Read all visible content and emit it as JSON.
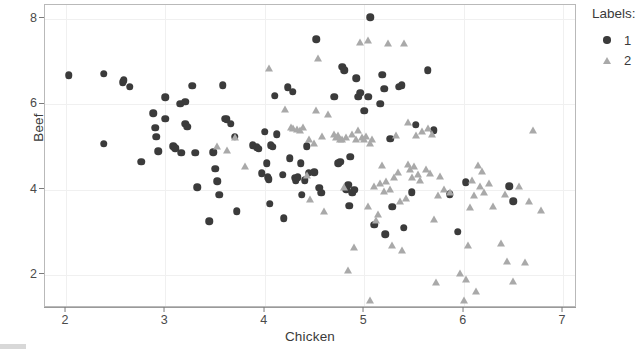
{
  "axes": {
    "x": {
      "title": "Chicken",
      "ticks": [
        2,
        3,
        4,
        5,
        6,
        7
      ],
      "min": 1.79,
      "max": 7.12
    },
    "y": {
      "title": "Beef",
      "ticks": [
        8,
        6,
        4,
        2
      ],
      "min": 1.28,
      "max": 8.33
    }
  },
  "legend": {
    "title": "Labels:",
    "entries": [
      {
        "label": "1",
        "marker": "circle-marker",
        "color": "#3b3b3b"
      },
      {
        "label": "2",
        "marker": "triangle-marker",
        "color": "#a9a9a9"
      }
    ]
  },
  "chart_data": {
    "type": "scatter",
    "title": "",
    "xlabel": "Chicken",
    "ylabel": "Beef",
    "xlim": [
      1.79,
      7.12
    ],
    "ylim": [
      1.28,
      8.33
    ],
    "grid": true,
    "legend_position": "right",
    "legend_title": "Labels:",
    "series": [
      {
        "name": "1",
        "marker": "circle",
        "color": "#3b3b3b",
        "points": [
          [
            2.03,
            6.68
          ],
          [
            2.38,
            6.72
          ],
          [
            2.38,
            5.08
          ],
          [
            2.57,
            6.52
          ],
          [
            2.58,
            6.57
          ],
          [
            2.64,
            6.41
          ],
          [
            2.76,
            4.66
          ],
          [
            2.88,
            5.8
          ],
          [
            2.9,
            5.46
          ],
          [
            2.91,
            5.25
          ],
          [
            2.93,
            4.9
          ],
          [
            3.0,
            6.17
          ],
          [
            3.0,
            5.66
          ],
          [
            3.08,
            5.02
          ],
          [
            3.1,
            4.97
          ],
          [
            3.15,
            6.02
          ],
          [
            3.16,
            4.87
          ],
          [
            3.2,
            6.06
          ],
          [
            3.2,
            5.55
          ],
          [
            3.22,
            5.48
          ],
          [
            3.27,
            6.44
          ],
          [
            3.3,
            4.87
          ],
          [
            3.32,
            4.06
          ],
          [
            3.44,
            3.26
          ],
          [
            3.48,
            4.88
          ],
          [
            3.5,
            4.49
          ],
          [
            3.52,
            4.2
          ],
          [
            3.54,
            3.88
          ],
          [
            3.58,
            6.45
          ],
          [
            3.6,
            5.66
          ],
          [
            3.62,
            5.65
          ],
          [
            3.66,
            5.55
          ],
          [
            3.7,
            5.24
          ],
          [
            3.72,
            3.5
          ],
          [
            3.88,
            5.04
          ],
          [
            3.92,
            5.0
          ],
          [
            3.94,
            4.96
          ],
          [
            3.97,
            4.39
          ],
          [
            4.0,
            5.36
          ],
          [
            4.02,
            4.62
          ],
          [
            4.03,
            4.29
          ],
          [
            4.04,
            4.25
          ],
          [
            4.05,
            3.67
          ],
          [
            4.06,
            5.05
          ],
          [
            4.08,
            5.01
          ],
          [
            4.1,
            6.21
          ],
          [
            4.12,
            5.3
          ],
          [
            4.18,
            4.35
          ],
          [
            4.19,
            3.34
          ],
          [
            4.23,
            6.4
          ],
          [
            4.25,
            4.74
          ],
          [
            4.28,
            6.3
          ],
          [
            4.3,
            4.28
          ],
          [
            4.31,
            4.23
          ],
          [
            4.33,
            4.3
          ],
          [
            4.36,
            4.62
          ],
          [
            4.37,
            3.88
          ],
          [
            4.4,
            4.22
          ],
          [
            4.42,
            5.02
          ],
          [
            4.44,
            4.4
          ],
          [
            4.5,
            4.41
          ],
          [
            4.52,
            7.53
          ],
          [
            4.55,
            4.05
          ],
          [
            4.57,
            3.93
          ],
          [
            4.7,
            6.18
          ],
          [
            4.74,
            4.62
          ],
          [
            4.76,
            4.66
          ],
          [
            4.78,
            6.88
          ],
          [
            4.8,
            6.8
          ],
          [
            4.82,
            4.02
          ],
          [
            4.84,
            4.12
          ],
          [
            4.85,
            3.63
          ],
          [
            4.86,
            4.78
          ],
          [
            4.88,
            3.93
          ],
          [
            4.9,
            4.0
          ],
          [
            4.92,
            6.62
          ],
          [
            4.94,
            6.18
          ],
          [
            4.96,
            6.27
          ],
          [
            5.0,
            5.85
          ],
          [
            5.04,
            6.18
          ],
          [
            5.06,
            8.04
          ],
          [
            5.1,
            3.18
          ],
          [
            5.16,
            6.02
          ],
          [
            5.18,
            6.7
          ],
          [
            5.2,
            6.37
          ],
          [
            5.21,
            2.96
          ],
          [
            5.26,
            5.2
          ],
          [
            5.28,
            3.61
          ],
          [
            5.35,
            6.42
          ],
          [
            5.38,
            6.45
          ],
          [
            5.4,
            3.11
          ],
          [
            5.48,
            3.95
          ],
          [
            5.52,
            5.53
          ],
          [
            5.64,
            6.8
          ],
          [
            5.7,
            5.4
          ],
          [
            5.86,
            3.9
          ],
          [
            5.94,
            3.02
          ],
          [
            6.02,
            4.18
          ],
          [
            6.46,
            4.08
          ],
          [
            6.5,
            3.73
          ]
        ]
      },
      {
        "name": "2",
        "marker": "triangle",
        "color": "#a9a9a9",
        "points": [
          [
            3.52,
            5.02
          ],
          [
            3.62,
            4.94
          ],
          [
            3.7,
            5.24
          ],
          [
            3.8,
            4.55
          ],
          [
            4.04,
            6.85
          ],
          [
            4.2,
            5.9
          ],
          [
            4.32,
            5.43
          ],
          [
            4.35,
            5.4
          ],
          [
            4.38,
            5.48
          ],
          [
            4.42,
            4.35
          ],
          [
            4.44,
            5.2
          ],
          [
            4.46,
            3.78
          ],
          [
            4.5,
            5.1
          ],
          [
            4.52,
            5.88
          ],
          [
            4.54,
            7.08
          ],
          [
            4.58,
            5.26
          ],
          [
            4.6,
            3.5
          ],
          [
            4.64,
            5.78
          ],
          [
            4.7,
            5.3
          ],
          [
            4.72,
            5.24
          ],
          [
            4.74,
            5.28
          ],
          [
            4.76,
            5.18
          ],
          [
            4.78,
            5.2
          ],
          [
            4.8,
            4.06
          ],
          [
            4.82,
            5.25
          ],
          [
            4.84,
            2.12
          ],
          [
            4.88,
            5.32
          ],
          [
            4.9,
            2.66
          ],
          [
            4.92,
            5.2
          ],
          [
            4.94,
            5.4
          ],
          [
            4.96,
            7.46
          ],
          [
            4.98,
            5.25
          ],
          [
            5.0,
            5.18
          ],
          [
            5.02,
            5.26
          ],
          [
            5.04,
            7.52
          ],
          [
            5.04,
            3.62
          ],
          [
            5.06,
            5.1
          ],
          [
            5.06,
            1.42
          ],
          [
            5.08,
            5.18
          ],
          [
            5.1,
            4.08
          ],
          [
            5.12,
            3.3
          ],
          [
            5.14,
            3.44
          ],
          [
            5.16,
            4.17
          ],
          [
            5.18,
            4.58
          ],
          [
            5.2,
            3.98
          ],
          [
            5.22,
            4.21
          ],
          [
            5.24,
            7.45
          ],
          [
            5.26,
            4.03
          ],
          [
            5.28,
            2.72
          ],
          [
            5.3,
            4.3
          ],
          [
            5.32,
            5.28
          ],
          [
            5.34,
            4.42
          ],
          [
            5.36,
            3.74
          ],
          [
            5.38,
            2.6
          ],
          [
            5.4,
            7.45
          ],
          [
            5.42,
            3.8
          ],
          [
            5.44,
            5.6
          ],
          [
            5.46,
            4.48
          ],
          [
            5.48,
            4.3
          ],
          [
            5.5,
            4.55
          ],
          [
            5.52,
            5.28
          ],
          [
            5.54,
            4.38
          ],
          [
            5.56,
            4.22
          ],
          [
            5.58,
            5.38
          ],
          [
            5.62,
            4.48
          ],
          [
            5.64,
            5.45
          ],
          [
            5.66,
            4.4
          ],
          [
            5.68,
            5.3
          ],
          [
            5.7,
            3.32
          ],
          [
            5.72,
            1.84
          ],
          [
            5.74,
            3.88
          ],
          [
            5.76,
            4.32
          ],
          [
            5.8,
            4.03
          ],
          [
            5.96,
            2.06
          ],
          [
            6.0,
            1.43
          ],
          [
            6.02,
            1.92
          ],
          [
            6.04,
            2.71
          ],
          [
            6.06,
            3.6
          ],
          [
            6.08,
            4.22
          ],
          [
            6.1,
            3.88
          ],
          [
            6.12,
            1.64
          ],
          [
            6.14,
            4.58
          ],
          [
            6.16,
            4.08
          ],
          [
            6.18,
            4.45
          ],
          [
            6.2,
            3.94
          ],
          [
            6.26,
            4.17
          ],
          [
            6.3,
            3.62
          ],
          [
            6.38,
            2.75
          ],
          [
            6.42,
            3.9
          ],
          [
            6.44,
            2.34
          ],
          [
            6.5,
            1.86
          ],
          [
            6.56,
            4.08
          ],
          [
            6.62,
            2.3
          ],
          [
            6.66,
            3.74
          ],
          [
            6.7,
            5.4
          ],
          [
            6.78,
            3.52
          ],
          [
            4.26,
            5.47
          ],
          [
            4.28,
            5.44
          ],
          [
            5.44,
            4.6
          ],
          [
            5.86,
            3.95
          ]
        ]
      }
    ]
  }
}
